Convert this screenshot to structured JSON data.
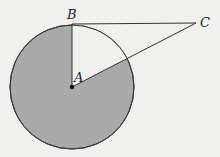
{
  "diagram": {
    "type": "geometry",
    "points": {
      "A": {
        "label": "A",
        "x": 72,
        "y": 87
      },
      "B": {
        "label": "B",
        "x": 72,
        "y": 24
      },
      "C": {
        "label": "C",
        "x": 196,
        "y": 23
      }
    },
    "circle": {
      "center": "A",
      "radius": 62
    },
    "segments": [
      "AB",
      "BC",
      "AC"
    ],
    "shaded_region": "circle minus sector BAC",
    "colors": {
      "shade": "#a9a9a9",
      "stroke": "#333333",
      "background": "#f1f1f0"
    }
  }
}
